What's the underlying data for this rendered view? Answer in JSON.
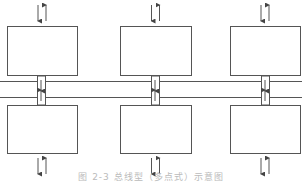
{
  "diagram": {
    "type": "bus-topology",
    "stroke_color": "#555555",
    "nodes_top": [
      {
        "id": "top-1",
        "x": 7,
        "y": 26,
        "w": 70,
        "h": 49
      },
      {
        "id": "top-2",
        "x": 120,
        "y": 26,
        "w": 71,
        "h": 49
      },
      {
        "id": "top-3",
        "x": 230,
        "y": 26,
        "w": 70,
        "h": 49
      }
    ],
    "nodes_bottom": [
      {
        "id": "bottom-1",
        "x": 7,
        "y": 105,
        "w": 70,
        "h": 48
      },
      {
        "id": "bottom-2",
        "x": 120,
        "y": 105,
        "w": 71,
        "h": 48
      },
      {
        "id": "bottom-3",
        "x": 230,
        "y": 105,
        "w": 70,
        "h": 48
      }
    ],
    "bus_lines_y": [
      81,
      97
    ],
    "connector_x": [
      41,
      155,
      265
    ]
  },
  "caption": "图 2-3 总线型（多点式）示意图"
}
